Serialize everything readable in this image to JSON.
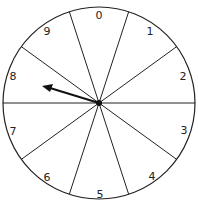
{
  "spinner": {
    "sectors": [
      "0",
      "1",
      "2",
      "3",
      "4",
      "5",
      "6",
      "7",
      "8",
      "9"
    ],
    "pointer_target": "8",
    "line_color": "#222222",
    "background": "#ffffff"
  }
}
